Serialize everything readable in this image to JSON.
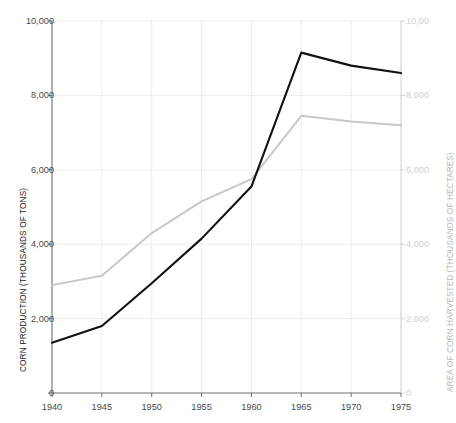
{
  "chart_data": {
    "type": "line",
    "title": "",
    "xlabel": "",
    "x": [
      1940,
      1945,
      1950,
      1955,
      1960,
      1965,
      1970,
      1975
    ],
    "xticks": [
      "1940",
      "1945",
      "1950",
      "1955",
      "1960",
      "1965",
      "1970",
      "1975"
    ],
    "xlim": [
      1940,
      1975
    ],
    "grid": true,
    "legend": "none",
    "axes": [
      {
        "id": "left",
        "label": "CORN PRODUCTION (THOUSANDS OF TONS)",
        "ylim": [
          0,
          10000
        ],
        "ticks": [
          0,
          2000,
          4000,
          6000,
          8000,
          10000
        ],
        "ticklabels": [
          "0",
          "2,000",
          "4,000",
          "6,000",
          "8,000",
          "10,000"
        ],
        "color": "#1a1a1a"
      },
      {
        "id": "right",
        "label": "AREA OF CORN HARVESTED (THOUSANDS OF HECTARES)",
        "ylim": [
          0,
          10000
        ],
        "ticks": [
          0,
          2000,
          4000,
          6000,
          8000,
          10000
        ],
        "ticklabels": [
          "0",
          "2,000",
          "4,000",
          "6,000",
          "8,000",
          "10,00"
        ],
        "color": "#cfcfcf"
      }
    ],
    "series": [
      {
        "name": "Corn production (thousands of tons)",
        "axis": "left",
        "color": "#111111",
        "values": [
          1350,
          1800,
          2950,
          4150,
          5550,
          9150,
          8800,
          8600
        ]
      },
      {
        "name": "Area of corn harvested (thousands of hectares)",
        "axis": "right",
        "color": "#c8c8c8",
        "values": [
          2900,
          3150,
          4300,
          5150,
          5750,
          7450,
          7300,
          7200
        ]
      }
    ]
  },
  "colors": {
    "background": "#ffffff",
    "grid": "#ededed",
    "axis_left": "#6e6e6e",
    "axis_right": "#d2d2d2",
    "series_production": "#111111",
    "series_area": "#c8c8c8"
  }
}
